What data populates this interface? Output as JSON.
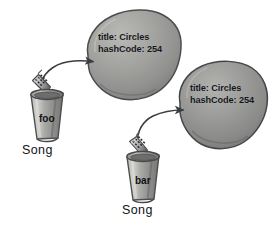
{
  "diagram": {
    "background_color": "#ffffff",
    "ink_color": "#3a3d42"
  },
  "objects": [
    {
      "id": "object-1",
      "name": "song-object-left",
      "shape": "blob",
      "fill_color": "#9a9a98",
      "stroke_color": "#4c4e50",
      "fields": [
        {
          "key": "title",
          "label": "title: Circles"
        },
        {
          "key": "hashCode",
          "label": "hashCode: 254"
        }
      ],
      "line1": "title: Circles",
      "line2": "hashCode: 254"
    },
    {
      "id": "object-2",
      "name": "song-object-right",
      "shape": "blob",
      "fill_color": "#8f8f8d",
      "stroke_color": "#47484a",
      "fields": [
        {
          "key": "title",
          "label": "title: Circles"
        },
        {
          "key": "hashCode",
          "label": "hashCode: 254"
        }
      ],
      "line1": "title: Circles",
      "line2": "hashCode: 254"
    }
  ],
  "references": [
    {
      "id": "reference-1",
      "name": "reference-foo",
      "variable": "foo",
      "type": "Song",
      "points_to": "object-1"
    },
    {
      "id": "reference-2",
      "name": "reference-bar",
      "variable": "bar",
      "type": "Song",
      "points_to": "object-2"
    }
  ],
  "arrows": [
    {
      "id": "arrow-1",
      "from": "reference-foo",
      "to": "song-object-left"
    },
    {
      "id": "arrow-2",
      "from": "reference-bar",
      "to": "song-object-right"
    }
  ]
}
